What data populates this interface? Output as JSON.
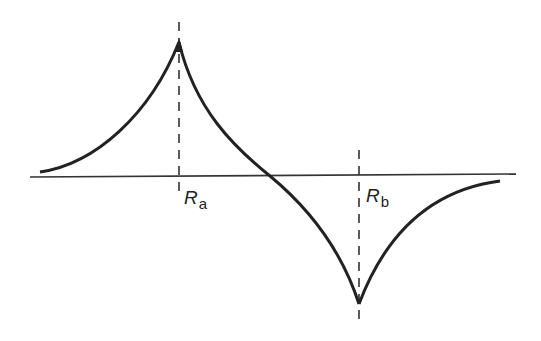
{
  "diagram": {
    "type": "potential-curve-cusp",
    "colors": {
      "line": "#222222",
      "background": "#ffffff"
    },
    "axis": {
      "y": 177,
      "x_start": 30,
      "x_end": 516
    },
    "markers": [
      {
        "id": "a",
        "label_main": "R",
        "label_sub": "a",
        "x": 179,
        "dash_top": 22,
        "dash_bottom": 196
      },
      {
        "id": "b",
        "label_main": "R",
        "label_sub": "b",
        "x": 359,
        "dash_top": 150,
        "dash_bottom": 320
      }
    ],
    "curve": {
      "left_branch": "M 40 171 C 95 162, 150 110, 179 40",
      "middle_branch": "M 179 40 C 200 110, 240 150, 270 177 C 300 205, 340 240, 359 306",
      "right_branch": "M 359 306 C 385 230, 430 190, 500 182"
    }
  }
}
